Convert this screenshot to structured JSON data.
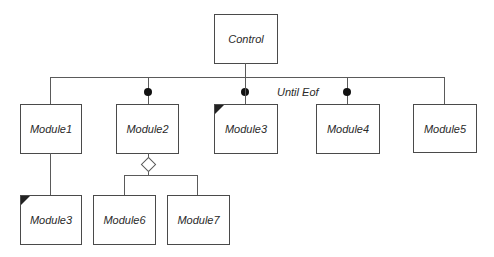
{
  "diagram": {
    "type": "structure-chart",
    "root": {
      "label": "Control"
    },
    "iteration_label": "Until Eof",
    "level1": [
      {
        "label": "Module1",
        "call": "plain",
        "library": false
      },
      {
        "label": "Module2",
        "call": "data-couple",
        "library": false
      },
      {
        "label": "Module3",
        "call": "data-couple",
        "library": true
      },
      {
        "label": "Module4",
        "call": "data-couple",
        "library": false
      },
      {
        "label": "Module5",
        "call": "plain",
        "library": false
      }
    ],
    "level2_under_module1": [
      {
        "label": "Module3",
        "library": true
      }
    ],
    "level2_under_module2": {
      "connector": "selection-diamond",
      "children": [
        {
          "label": "Module6",
          "library": false
        },
        {
          "label": "Module7",
          "library": false
        }
      ]
    },
    "colors": {
      "line": "#5a5a5a",
      "box_border": "#4a4a4a",
      "dot": "#111111",
      "text": "#2a2a2a"
    }
  }
}
